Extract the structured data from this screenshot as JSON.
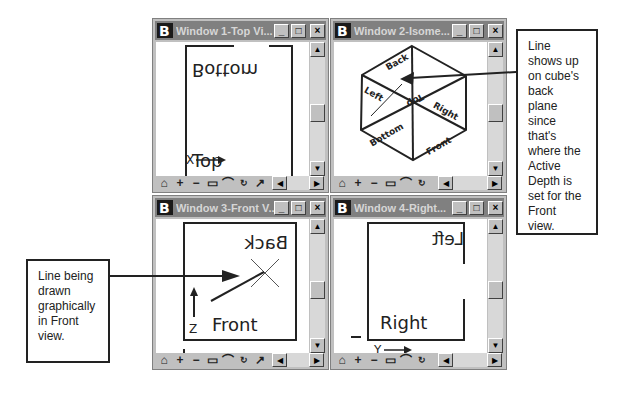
{
  "windows": [
    {
      "id": 1,
      "title": "Window 1-Top Vi...",
      "view": "Top",
      "labels": {
        "top_text": "Bottom",
        "bottom_text": "Top",
        "axis": "X"
      }
    },
    {
      "id": 2,
      "title": "Window 2-Isome...",
      "view": "Isometric",
      "labels": {
        "back": "Back",
        "left": "Left",
        "top": "Top",
        "right": "Right",
        "bottom": "Bottom",
        "front": "Front"
      }
    },
    {
      "id": 3,
      "title": "Window 3-Front V...",
      "view": "Front",
      "labels": {
        "top_text": "Back",
        "bottom_text": "Front",
        "axis": "Z"
      }
    },
    {
      "id": 4,
      "title": "Window 4-Right...",
      "view": "Right",
      "labels": {
        "top_text": "Left",
        "bottom_text": "Right",
        "axis": "Y"
      }
    }
  ],
  "window_controls": {
    "minimize": "_",
    "maximize": "□",
    "close": "×"
  },
  "toolbar_icons": [
    "update-icon",
    "zoom-in-icon",
    "zoom-out-icon",
    "window-area-icon",
    "fit-view-icon",
    "rotate-view-icon",
    "pan-icon"
  ],
  "callouts": {
    "right": "Line shows up on cube's back plane since that's where the Active Depth is set for the Front view.",
    "left": "Line being drawn graphically in Front view."
  },
  "colors": {
    "titlebar_inactive": "#808080",
    "window_frame": "#c0c0c0",
    "viewport": "#ffffff"
  }
}
